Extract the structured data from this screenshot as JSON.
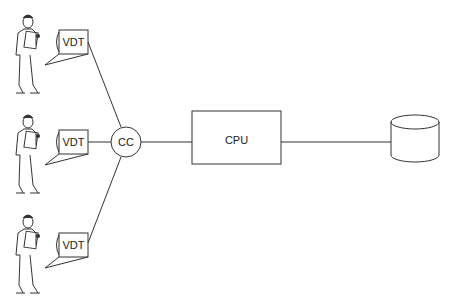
{
  "diagram": {
    "terminals": [
      {
        "label": "VDT",
        "operator": "person-with-clipboard"
      },
      {
        "label": "VDT",
        "operator": "person-with-clipboard"
      },
      {
        "label": "VDT",
        "operator": "person-with-clipboard"
      }
    ],
    "concentrator": {
      "label": "CC"
    },
    "processor": {
      "label": "CPU"
    },
    "storage": {
      "label": "",
      "shape": "cylinder"
    },
    "colors": {
      "line": "#333333",
      "background": "#ffffff"
    }
  }
}
